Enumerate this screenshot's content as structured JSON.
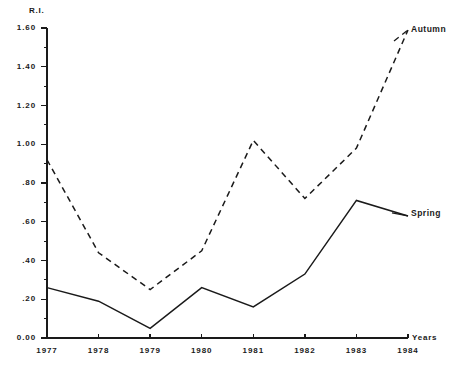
{
  "chart_data": {
    "type": "line",
    "title": "",
    "subtitle": "",
    "xlabel": "Years",
    "ylabel": "R.I.",
    "categories": [
      "1977",
      "1978",
      "1979",
      "1980",
      "1981",
      "1982",
      "1983",
      "1984"
    ],
    "x": [
      1977,
      1978,
      1979,
      1980,
      1981,
      1982,
      1983,
      1984
    ],
    "xlim": [
      1977,
      1984
    ],
    "ylim": [
      0.0,
      1.6
    ],
    "y_ticks": [
      0.0,
      0.2,
      0.4,
      0.6,
      0.8,
      1.0,
      1.2,
      1.4,
      1.6
    ],
    "y_tick_labels": [
      "0.00",
      ".20",
      ".40",
      ".60",
      ".80",
      "1.00",
      "1.20",
      "1.40",
      "1.60"
    ],
    "y_minor_ticks": [
      0.1,
      0.3,
      0.5,
      0.7,
      0.9,
      1.1,
      1.3,
      1.5
    ],
    "grid": false,
    "legend_position": "inline-right-annotations",
    "series": [
      {
        "name": "Autumn",
        "style": "dashed",
        "color": "#1a1a1a",
        "values": [
          0.92,
          0.44,
          0.25,
          0.45,
          1.02,
          0.72,
          0.98,
          1.59
        ]
      },
      {
        "name": "Spring",
        "style": "solid",
        "color": "#1a1a1a",
        "values": [
          0.26,
          0.19,
          0.05,
          0.26,
          0.16,
          0.33,
          0.71,
          0.63
        ]
      }
    ],
    "annotations": [
      {
        "text": "Autumn",
        "series": "Autumn",
        "at_x": 1984
      },
      {
        "text": "Spring",
        "series": "Spring",
        "at_x": 1984
      }
    ]
  },
  "axis": {
    "y_title": "R.I.",
    "x_title": "Years",
    "y_labels": {
      "t0": "0.00",
      "t1": ".20",
      "t2": ".40",
      "t3": ".60",
      "t4": ".80",
      "t5": "1.00",
      "t6": "1.20",
      "t7": "1.40",
      "t8": "1.60"
    },
    "x_labels": {
      "c0": "1977",
      "c1": "1978",
      "c2": "1979",
      "c3": "1980",
      "c4": "1981",
      "c5": "1982",
      "c6": "1983",
      "c7": "1984"
    }
  },
  "labels": {
    "autumn": "Autumn",
    "spring": "Spring"
  },
  "colors": {
    "ink": "#1a1a1a",
    "background": "#ffffff"
  }
}
